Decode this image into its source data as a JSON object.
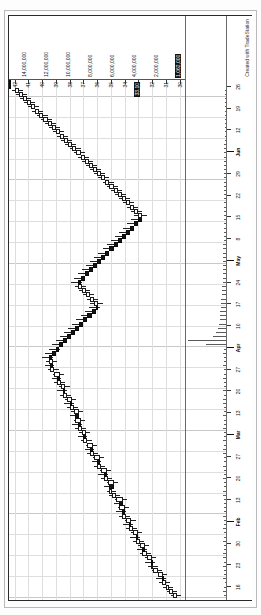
{
  "window": {
    "symbol_label": "GBP  Daily  563243",
    "credit": "Created with TradeStation"
  },
  "price_axis": {
    "unit": "",
    "labels": [
      "42",
      "41",
      "40",
      "39",
      "38",
      "37",
      "36",
      "35",
      "34",
      "33",
      "32",
      "31",
      "30"
    ],
    "highlight_label": "33.10",
    "ticks": [
      42,
      41,
      40,
      39,
      38,
      37,
      36,
      35,
      34,
      33,
      32,
      31,
      30
    ]
  },
  "scale_strip": {
    "values": [
      "14,000,000",
      "12,000,000",
      "10,000,000",
      "8,000,000",
      "6,000,000",
      "4,000,000",
      "2,000,000"
    ],
    "highlight": "1,062,000"
  },
  "date_axis": {
    "labels": [
      "16",
      "23",
      "30",
      "Feb",
      "13",
      "20",
      "27",
      "Mar",
      "13",
      "20",
      "27",
      "Apr",
      "10",
      "17",
      "24",
      "May",
      "8",
      "15",
      "22",
      "29",
      "Jun",
      "12",
      "19",
      "26"
    ],
    "month_labels": [
      "Feb",
      "Mar",
      "Apr",
      "May",
      "Jun"
    ]
  },
  "colors": {
    "up_body": "#ffffff",
    "down_body": "#141414",
    "outline": "#1a1a1a",
    "grid": "#dedede",
    "frame": "#2a2a2a",
    "volume": "#5a5a5a",
    "highlight_bg": "#111111",
    "highlight_fg": "#ffffff"
  },
  "chart_data": {
    "type": "candlestick",
    "title": "GBP Daily 563243",
    "xlabel": "",
    "ylabel": "",
    "ylim": [
      29.6,
      42.4
    ],
    "grid": true,
    "legend": "none",
    "orientation": "rotated-90",
    "x": [
      "Jan 02",
      "Jan 03",
      "Jan 04",
      "Jan 05",
      "Jan 08",
      "Jan 09",
      "Jan 10",
      "Jan 11",
      "Jan 12",
      "Jan 16",
      "Jan 17",
      "Jan 18",
      "Jan 19",
      "Jan 22",
      "Jan 23",
      "Jan 24",
      "Jan 25",
      "Jan 26",
      "Jan 29",
      "Jan 30",
      "Jan 31",
      "Feb 01",
      "Feb 02",
      "Feb 05",
      "Feb 06",
      "Feb 07",
      "Feb 08",
      "Feb 09",
      "Feb 12",
      "Feb 13",
      "Feb 14",
      "Feb 15",
      "Feb 16",
      "Feb 20",
      "Feb 21",
      "Feb 22",
      "Feb 23",
      "Feb 26",
      "Feb 27",
      "Feb 28",
      "Mar 01",
      "Mar 02",
      "Mar 05",
      "Mar 06",
      "Mar 07",
      "Mar 08",
      "Mar 09",
      "Mar 12",
      "Mar 13",
      "Mar 14",
      "Mar 15",
      "Mar 16",
      "Mar 19",
      "Mar 20",
      "Mar 21",
      "Mar 22",
      "Mar 23",
      "Mar 26",
      "Mar 27",
      "Mar 28",
      "Mar 29",
      "Apr 02",
      "Apr 03",
      "Apr 04",
      "Apr 05",
      "Apr 06",
      "Apr 09",
      "Apr 10",
      "Apr 11",
      "Apr 12",
      "Apr 13",
      "Apr 16",
      "Apr 17",
      "Apr 18",
      "Apr 19",
      "Apr 20",
      "Apr 23",
      "Apr 24",
      "Apr 25",
      "Apr 26",
      "Apr 27",
      "Apr 30",
      "May 01",
      "May 02",
      "May 03",
      "May 04",
      "May 07",
      "May 08",
      "May 09",
      "May 10",
      "May 11",
      "May 14",
      "May 15",
      "May 16",
      "May 17",
      "May 18",
      "May 21",
      "May 22",
      "May 23",
      "May 24",
      "May 25",
      "May 29",
      "May 30",
      "May 31",
      "Jun 01",
      "Jun 04",
      "Jun 05",
      "Jun 06",
      "Jun 07",
      "Jun 08",
      "Jun 11",
      "Jun 12",
      "Jun 13",
      "Jun 14",
      "Jun 15",
      "Jun 18",
      "Jun 19",
      "Jun 20",
      "Jun 21",
      "Jun 22",
      "Jun 25",
      "Jun 26",
      "Jun 27",
      "Jun 28",
      "Jun 29"
    ],
    "open": [
      30.2,
      30.5,
      30.8,
      31.0,
      31.3,
      31.2,
      31.6,
      31.9,
      32.1,
      32.0,
      32.4,
      32.7,
      32.5,
      32.9,
      33.2,
      33.0,
      33.4,
      33.7,
      33.5,
      33.9,
      34.2,
      34.0,
      34.4,
      34.1,
      34.6,
      34.9,
      35.1,
      34.8,
      35.2,
      35.5,
      35.3,
      35.7,
      36.0,
      35.8,
      36.2,
      36.5,
      36.3,
      36.7,
      37.0,
      36.8,
      37.1,
      37.4,
      37.2,
      37.6,
      37.3,
      37.7,
      38.0,
      37.8,
      38.2,
      38.5,
      38.3,
      38.6,
      38.9,
      38.7,
      39.1,
      39.4,
      39.2,
      39.5,
      39.3,
      39.0,
      38.8,
      38.5,
      38.2,
      37.9,
      37.6,
      37.3,
      37.0,
      36.7,
      36.4,
      36.1,
      35.9,
      36.2,
      36.5,
      36.8,
      37.1,
      37.4,
      37.2,
      36.9,
      36.6,
      36.3,
      36.0,
      35.7,
      35.4,
      35.1,
      34.8,
      34.5,
      34.2,
      33.9,
      33.6,
      33.3,
      33.0,
      32.7,
      33.0,
      33.3,
      33.6,
      33.9,
      34.2,
      34.5,
      34.8,
      35.1,
      35.4,
      35.7,
      36.0,
      36.3,
      36.6,
      36.9,
      37.2,
      37.5,
      37.8,
      38.1,
      38.4,
      38.7,
      39.0,
      39.3,
      39.6,
      39.9,
      40.2,
      40.5,
      40.8,
      41.1,
      41.4,
      41.7
    ],
    "high": [
      30.6,
      30.9,
      31.2,
      31.5,
      31.7,
      31.6,
      32.0,
      32.3,
      32.5,
      32.5,
      32.9,
      33.1,
      33.0,
      33.4,
      33.6,
      33.5,
      33.9,
      34.1,
      34.0,
      34.4,
      34.6,
      34.5,
      34.8,
      34.7,
      35.1,
      35.3,
      35.5,
      35.3,
      35.7,
      35.9,
      35.8,
      36.2,
      36.4,
      36.3,
      36.7,
      36.9,
      36.8,
      37.2,
      37.4,
      37.3,
      37.6,
      37.8,
      37.7,
      38.0,
      37.9,
      38.2,
      38.4,
      38.3,
      38.7,
      38.9,
      38.8,
      39.1,
      39.3,
      39.2,
      39.6,
      39.8,
      39.7,
      40.0,
      39.8,
      39.5,
      39.3,
      39.0,
      38.7,
      38.4,
      38.1,
      37.8,
      37.5,
      37.2,
      36.9,
      36.6,
      36.5,
      36.7,
      37.0,
      37.3,
      37.6,
      37.9,
      37.7,
      37.4,
      37.1,
      36.8,
      36.5,
      36.2,
      35.9,
      35.6,
      35.3,
      35.0,
      34.7,
      34.4,
      34.1,
      33.8,
      33.5,
      33.3,
      33.5,
      33.8,
      34.1,
      34.4,
      34.7,
      35.0,
      35.3,
      35.6,
      35.9,
      36.2,
      36.5,
      36.8,
      37.1,
      37.4,
      37.7,
      38.0,
      38.3,
      38.6,
      38.9,
      39.2,
      39.5,
      39.8,
      40.1,
      40.4,
      40.7,
      41.0,
      41.3,
      41.6,
      41.9,
      42.2
    ],
    "low": [
      29.9,
      30.2,
      30.5,
      30.7,
      31.0,
      30.9,
      31.3,
      31.6,
      31.8,
      31.7,
      32.1,
      32.4,
      32.2,
      32.6,
      32.9,
      32.7,
      33.1,
      33.4,
      33.2,
      33.6,
      33.9,
      33.7,
      34.1,
      33.8,
      34.3,
      34.6,
      34.8,
      34.5,
      34.9,
      35.2,
      35.0,
      35.4,
      35.7,
      35.5,
      35.9,
      36.2,
      36.0,
      36.4,
      36.7,
      36.5,
      36.8,
      37.1,
      36.9,
      37.3,
      37.0,
      37.4,
      37.7,
      37.5,
      37.9,
      38.2,
      38.0,
      38.3,
      38.6,
      38.4,
      38.8,
      39.1,
      38.9,
      39.2,
      39.0,
      38.7,
      38.5,
      38.2,
      37.9,
      37.6,
      37.3,
      37.0,
      36.7,
      36.4,
      36.1,
      35.8,
      35.6,
      35.9,
      36.2,
      36.5,
      36.8,
      37.1,
      36.9,
      36.6,
      36.3,
      36.0,
      35.7,
      35.4,
      35.1,
      34.8,
      34.5,
      34.2,
      33.9,
      33.6,
      33.3,
      33.0,
      32.7,
      32.4,
      32.7,
      33.0,
      33.3,
      33.6,
      33.9,
      34.2,
      34.5,
      34.8,
      35.1,
      35.4,
      35.7,
      36.0,
      36.3,
      36.6,
      36.9,
      37.2,
      37.5,
      37.8,
      38.1,
      38.4,
      38.7,
      39.0,
      39.3,
      39.6,
      39.9,
      40.2,
      40.5,
      40.8,
      41.1,
      41.4
    ],
    "close": [
      30.5,
      30.8,
      31.0,
      31.3,
      31.2,
      31.6,
      31.9,
      32.1,
      32.0,
      32.4,
      32.7,
      32.5,
      32.9,
      33.2,
      33.0,
      33.4,
      33.7,
      33.5,
      33.9,
      34.2,
      34.0,
      34.4,
      34.1,
      34.6,
      34.9,
      35.1,
      34.8,
      35.2,
      35.5,
      35.3,
      35.7,
      36.0,
      35.8,
      36.2,
      36.5,
      36.3,
      36.7,
      37.0,
      36.8,
      37.1,
      37.4,
      37.2,
      37.6,
      37.3,
      37.7,
      38.0,
      37.8,
      38.2,
      38.5,
      38.3,
      38.6,
      38.9,
      38.7,
      39.1,
      39.4,
      39.2,
      39.5,
      39.3,
      39.0,
      38.8,
      38.5,
      38.2,
      37.9,
      37.6,
      37.3,
      37.0,
      36.7,
      36.4,
      36.1,
      35.9,
      36.2,
      36.5,
      36.8,
      37.1,
      37.4,
      37.2,
      36.9,
      36.6,
      36.3,
      36.0,
      35.7,
      35.4,
      35.1,
      34.8,
      34.5,
      34.2,
      33.9,
      33.6,
      33.3,
      33.0,
      32.7,
      33.0,
      33.3,
      33.6,
      33.9,
      34.2,
      34.5,
      34.8,
      35.1,
      35.4,
      35.7,
      36.0,
      36.3,
      36.6,
      36.9,
      37.2,
      37.5,
      37.8,
      38.1,
      38.4,
      38.7,
      39.0,
      39.3,
      39.6,
      39.9,
      40.2,
      40.5,
      40.8,
      41.1,
      41.4,
      41.7,
      42.0
    ],
    "volume": [
      120000,
      180000,
      140000,
      95000,
      210000,
      160000,
      130000,
      175000,
      145000,
      220000,
      190000,
      155000,
      135000,
      205000,
      165000,
      125000,
      185000,
      150000,
      140000,
      195000,
      170000,
      130000,
      160000,
      145000,
      200000,
      175000,
      155000,
      135000,
      190000,
      165000,
      145000,
      180000,
      160000,
      140000,
      205000,
      175000,
      150000,
      185000,
      165000,
      145000,
      195000,
      170000,
      150000,
      180000,
      160000,
      140000,
      200000,
      175000,
      155000,
      190000,
      165000,
      145000,
      185000,
      160000,
      140000,
      195000,
      170000,
      150000,
      180000,
      160000,
      1400000,
      2600000,
      900000,
      700000,
      520000,
      480000,
      430000,
      400000,
      380000,
      350000,
      330000,
      310000,
      290000,
      270000,
      250000,
      240000,
      230000,
      220000,
      210000,
      200000,
      195000,
      190000,
      185000,
      180000,
      175000,
      170000,
      165000,
      160000,
      155000,
      150000,
      145000,
      140000,
      138000,
      135000,
      132000,
      130000,
      128000,
      126000,
      124000,
      122000,
      120000,
      118000,
      116000,
      114000,
      112000,
      110000,
      108000,
      106000,
      104000,
      102000,
      100000,
      98000,
      96000,
      94000,
      92000,
      90000,
      88000,
      86000,
      84000,
      82000,
      80000,
      78000
    ]
  }
}
